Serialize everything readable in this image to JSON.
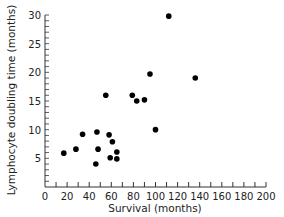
{
  "chart_data": {
    "type": "scatter",
    "title": "",
    "xlabel": "Survival  (months)",
    "ylabel": "Lymphocyte doubling time (months)",
    "xlim": [
      0,
      200
    ],
    "ylim": [
      0,
      30
    ],
    "x_ticks": [
      0,
      20,
      40,
      60,
      80,
      100,
      120,
      140,
      160,
      180,
      200
    ],
    "y_ticks": [
      0,
      5,
      10,
      15,
      20,
      25,
      30
    ],
    "grid": false,
    "legend": null,
    "series": [
      {
        "name": "patients",
        "marker": "filled-circle",
        "color": "#000000",
        "points": [
          {
            "x": 17,
            "y": 5.9
          },
          {
            "x": 28,
            "y": 6.6
          },
          {
            "x": 34,
            "y": 9.2
          },
          {
            "x": 46,
            "y": 4.0
          },
          {
            "x": 47,
            "y": 9.6
          },
          {
            "x": 48,
            "y": 6.6
          },
          {
            "x": 55,
            "y": 16.0
          },
          {
            "x": 58,
            "y": 9.1
          },
          {
            "x": 59,
            "y": 5.1
          },
          {
            "x": 61,
            "y": 7.9
          },
          {
            "x": 65,
            "y": 6.1
          },
          {
            "x": 65,
            "y": 4.9
          },
          {
            "x": 79,
            "y": 16.0
          },
          {
            "x": 83,
            "y": 15.0
          },
          {
            "x": 90,
            "y": 15.2
          },
          {
            "x": 95,
            "y": 19.7
          },
          {
            "x": 100,
            "y": 10.0
          },
          {
            "x": 112,
            "y": 29.8
          },
          {
            "x": 136,
            "y": 19.0
          }
        ]
      }
    ]
  },
  "labels": {
    "xlabel": "Survival  (months)",
    "ylabel": "Lymphocyte doubling time (months)"
  }
}
